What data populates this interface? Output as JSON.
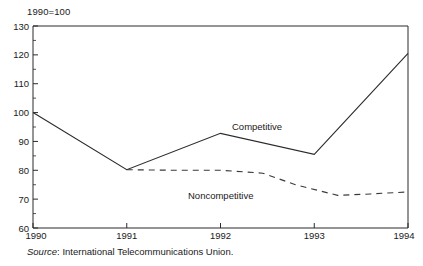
{
  "figure": {
    "unit_label": "1990=100",
    "source_prefix": "Source",
    "source_text": ":  International Telecommunications Union."
  },
  "chart_data": {
    "type": "line",
    "title": "",
    "subtitle": "",
    "xlabel": "",
    "ylabel": "1990=100",
    "categories": [
      "1990",
      "1991",
      "1992",
      "1993",
      "1994"
    ],
    "x": [
      1990,
      1991,
      1992,
      1993,
      1994
    ],
    "xlim": [
      1990,
      1994
    ],
    "ylim": [
      60,
      130
    ],
    "y_ticks": [
      60,
      70,
      80,
      90,
      100,
      110,
      120,
      130
    ],
    "y_minor_ticks": [
      65,
      75,
      85,
      95,
      105,
      115,
      125
    ],
    "x_ticks": [
      1990,
      1991,
      1992,
      1993,
      1994
    ],
    "grid": false,
    "legend_position": "inline-annotation",
    "series": [
      {
        "name": "Competitive",
        "style": "solid",
        "color": "#2b2b2b",
        "x": [
          1990,
          1991,
          1992,
          1993,
          1994
        ],
        "values": [
          100.0,
          80.2,
          92.8,
          85.5,
          120.5
        ],
        "label_text": "Competitive"
      },
      {
        "name": "Noncompetitive",
        "style": "dashed",
        "color": "#3a3a3a",
        "x": [
          1991.0,
          1991.55,
          1992.0,
          1992.45,
          1992.8,
          1993.25,
          1993.6,
          1994.0
        ],
        "values": [
          80.2,
          80.0,
          80.0,
          79.0,
          75.0,
          71.3,
          71.8,
          72.5
        ],
        "label_text": "Noncompetitive"
      }
    ],
    "annotations": [
      {
        "text": "Competitive",
        "x": 1992.12,
        "y": 95.0
      },
      {
        "text": "Noncompetitive",
        "x": 1991.78,
        "y": 72.8
      },
      {
        "text": "1990=100",
        "x": 1990.0,
        "y": 133.5
      }
    ]
  }
}
